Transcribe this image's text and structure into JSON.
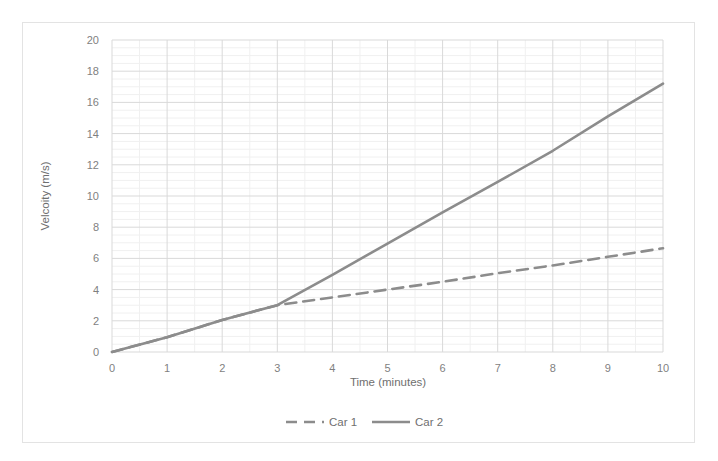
{
  "chart_data": {
    "type": "line",
    "title": "",
    "xlabel": "Time (minutes)",
    "ylabel": "Velcoity (m/s)",
    "xlim": [
      0,
      10
    ],
    "ylim": [
      0,
      20
    ],
    "xticks": [
      "0",
      "1",
      "2",
      "3",
      "4",
      "5",
      "6",
      "7",
      "8",
      "9",
      "10"
    ],
    "yticks": [
      "0",
      "2",
      "4",
      "6",
      "8",
      "10",
      "12",
      "14",
      "16",
      "18",
      "20"
    ],
    "grid": true,
    "minor_grid": true,
    "legend_position": "bottom-center",
    "x": [
      0,
      1,
      2,
      3,
      4,
      5,
      6,
      7,
      8,
      9,
      10
    ],
    "series": [
      {
        "name": "Car 1",
        "style": "dashed",
        "color": "#8c8c8c",
        "values": [
          0,
          0.95,
          2.05,
          3.0,
          3.5,
          4.0,
          4.5,
          5.05,
          5.55,
          6.1,
          6.65
        ]
      },
      {
        "name": "Car 2",
        "style": "solid",
        "color": "#8c8c8c",
        "values": [
          0,
          0.95,
          2.05,
          3.0,
          4.95,
          6.95,
          8.95,
          10.9,
          12.9,
          15.1,
          17.2
        ]
      }
    ],
    "legend": [
      {
        "label": "Car 1",
        "style": "dashed",
        "color": "#8c8c8c"
      },
      {
        "label": "Car 2",
        "style": "solid",
        "color": "#8c8c8c"
      }
    ],
    "colors": {
      "background": "#ffffff",
      "frame_border": "#e3e3e3",
      "major_gridline": "#d9d9d9",
      "minor_gridline": "#f0f0f0",
      "tick_label": "#7f7f7f",
      "axis_title": "#6f6f6f",
      "line": "#8c8c8c"
    }
  }
}
